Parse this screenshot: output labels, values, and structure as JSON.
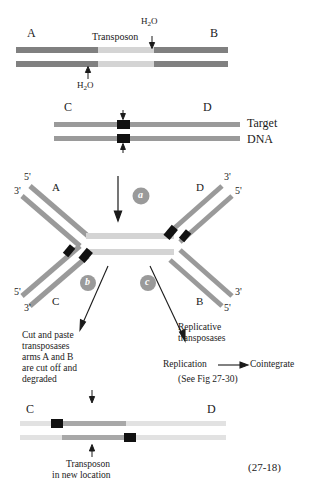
{
  "figure": {
    "number": "(27-18)",
    "title_implicit": "Transposition mechanisms: cut-and-paste vs replicative"
  },
  "colors": {
    "arm_dark_gray": "#808080",
    "transposon_light_gray": "#d4d4d4",
    "transposon_mid_gray": "#a8a8a8",
    "target_gray": "#9a9a9a",
    "target_pale": "#e2e2e2",
    "insertion_black": "#111111",
    "circle_gray": "#9a9a9a",
    "text_black": "#1a1a1a"
  },
  "panel_donor": {
    "left_arm_label": "A",
    "right_arm_label": "B",
    "transposon_label": "Transposon",
    "water_top": "H",
    "water_top_sub": "2",
    "water_top_suffix": "O",
    "water_bottom": "H",
    "water_bottom_sub": "2",
    "water_bottom_suffix": "O"
  },
  "panel_target": {
    "left_label": "C",
    "right_label": "D",
    "name_line1": "Target",
    "name_line2": "DNA"
  },
  "panel_intermediate": {
    "step_label": "a",
    "arm_top_left": "A",
    "arm_top_right": "D",
    "arm_bottom_left": "C",
    "arm_bottom_right": "B",
    "ends": {
      "top_left_upper": "5'",
      "top_left_lower": "3'",
      "top_right_upper": "3'",
      "top_right_lower": "5'",
      "bottom_left_upper": "5'",
      "bottom_left_lower": "3'",
      "bottom_right_upper": "3'",
      "bottom_right_lower": "5'"
    }
  },
  "branch_left": {
    "step_label": "b",
    "text_lines": [
      "Cut and paste",
      "transposases",
      "arms A and B",
      "are cut off and",
      "degraded"
    ]
  },
  "branch_right": {
    "step_label": "c",
    "text_lines": [
      "Replicative",
      "transposases"
    ],
    "replication_label": "Replication",
    "cointegrate_label": "Cointegrate",
    "cross_reference": "(See Fig 27-30)"
  },
  "panel_product": {
    "left_label": "C",
    "right_label": "D",
    "caption_line1": "Transposon",
    "caption_line2": "in new location"
  }
}
